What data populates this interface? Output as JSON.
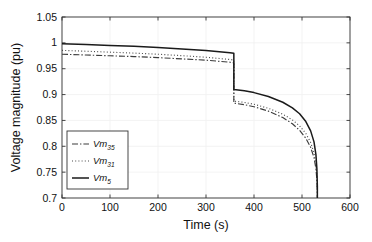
{
  "chart_data": {
    "type": "line",
    "title": "",
    "xlabel": "Time (s)",
    "ylabel": "Voltage magnitude (pu)",
    "xlim": [
      0,
      600
    ],
    "ylim": [
      0.7,
      1.05
    ],
    "xticks": [
      0,
      100,
      200,
      300,
      400,
      500,
      600
    ],
    "yticks": [
      0.7,
      0.75,
      0.8,
      0.85,
      0.9,
      0.95,
      1,
      1.05
    ],
    "xtick_labels": [
      "0",
      "100",
      "200",
      "300",
      "400",
      "500",
      "600"
    ],
    "ytick_labels": [
      "0.7",
      "0.75",
      "0.8",
      "0.85",
      "0.9",
      "0.95",
      "1",
      "1.05"
    ],
    "grid": true,
    "legend_position": "lower-left-inside",
    "event_times": {
      "step_drop_s": 358,
      "voltage_collapse_s": 532
    },
    "series": [
      {
        "name": "Vm35",
        "label_base": "Vm",
        "label_sub": "35",
        "style": "dashdot",
        "color": "#3c3c3c",
        "x": [
          0,
          50,
          100,
          150,
          200,
          250,
          300,
          350,
          358,
          358,
          380,
          400,
          430,
          460,
          480,
          495,
          508,
          518,
          525,
          529,
          531,
          532,
          532
        ],
        "y": [
          0.978,
          0.9765,
          0.975,
          0.9735,
          0.9715,
          0.969,
          0.9665,
          0.9625,
          0.9615,
          0.8835,
          0.8805,
          0.8765,
          0.868,
          0.8555,
          0.8435,
          0.831,
          0.8155,
          0.798,
          0.778,
          0.757,
          0.735,
          0.71,
          0.7
        ]
      },
      {
        "name": "Vm31",
        "label_base": "Vm",
        "label_sub": "31",
        "style": "dotted",
        "color": "#4a4a4a",
        "x": [
          0,
          50,
          100,
          150,
          200,
          250,
          300,
          350,
          358,
          358,
          380,
          400,
          430,
          460,
          480,
          495,
          508,
          518,
          525,
          529,
          531,
          532,
          532
        ],
        "y": [
          0.9855,
          0.9838,
          0.982,
          0.9802,
          0.978,
          0.9752,
          0.9722,
          0.9678,
          0.9668,
          0.8875,
          0.8848,
          0.8812,
          0.8735,
          0.862,
          0.851,
          0.8395,
          0.8248,
          0.8075,
          0.787,
          0.764,
          0.74,
          0.712,
          0.7
        ]
      },
      {
        "name": "Vm5",
        "label_base": "Vm",
        "label_sub": "5",
        "style": "solid",
        "color": "#1a1a1a",
        "x": [
          0,
          50,
          100,
          150,
          200,
          250,
          300,
          350,
          358,
          358,
          380,
          400,
          430,
          460,
          480,
          495,
          508,
          518,
          525,
          529,
          531,
          532,
          532
        ],
        "y": [
          0.9985,
          0.9968,
          0.995,
          0.9932,
          0.991,
          0.9882,
          0.9852,
          0.9808,
          0.9798,
          0.9098,
          0.9072,
          0.9038,
          0.8962,
          0.8852,
          0.8742,
          0.863,
          0.8478,
          0.8298,
          0.8085,
          0.784,
          0.757,
          0.723,
          0.7
        ]
      }
    ]
  },
  "legend": {
    "items": [
      {
        "base": "Vm",
        "sub": "35"
      },
      {
        "base": "Vm",
        "sub": "31"
      },
      {
        "base": "Vm",
        "sub": "5"
      }
    ]
  },
  "colors": {
    "axis": "#333333",
    "grid": "#f0f0f0",
    "background": "#ffffff",
    "text": "#111111"
  }
}
